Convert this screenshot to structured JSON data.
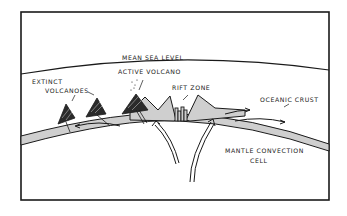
{
  "diagram": {
    "labels": {
      "sea_level": "MEAN SEA LEVEL",
      "extinct_1": "EXTINCT",
      "extinct_2": "VOLCANOES",
      "active": "ACTIVE VOLCANO",
      "rift": "RIFT  ZONE",
      "crust": "OCEANIC CRUST",
      "mantle_1": "MANTLE  CONVECTION",
      "mantle_2": "CELL"
    },
    "colors": {
      "line": "#1a1a1a",
      "crust_fill": "#cfcfcf",
      "background": "#ffffff"
    }
  }
}
